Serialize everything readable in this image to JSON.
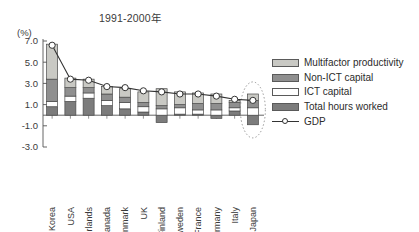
{
  "chart_data": {
    "type": "bar",
    "subtype": "stacked-bar-with-line-overlay",
    "title": "1991-2000年",
    "xlabel": "",
    "ylabel": "(%)",
    "ylim": [
      -3.0,
      7.0
    ],
    "yticks": [
      "7.0",
      "5.0",
      "3.0",
      "1.0",
      "-1.0",
      "-3.0"
    ],
    "ytick_values": [
      7.0,
      5.0,
      3.0,
      1.0,
      -1.0,
      -3.0
    ],
    "grid": false,
    "legend_position": "right",
    "categories": [
      "Korea",
      "USA",
      "Netherlands",
      "Canada",
      "Denmark",
      "UK",
      "Finland",
      "Sweden",
      "France",
      "Germany",
      "Italy",
      "Japan"
    ],
    "series": [
      {
        "name": "Total hours worked",
        "color": "#7c7c7c",
        "values": [
          0.8,
          1.3,
          1.6,
          0.9,
          0.6,
          0.3,
          -0.7,
          0.1,
          0.1,
          -0.3,
          0.4,
          -0.9
        ]
      },
      {
        "name": "ICT capital",
        "color": "#ffffff",
        "values": [
          0.5,
          0.5,
          0.5,
          0.5,
          0.6,
          0.5,
          0.6,
          0.6,
          0.4,
          0.5,
          0.3,
          0.7
        ]
      },
      {
        "name": "Non-ICT capital",
        "color": "#8f8f8f",
        "values": [
          2.1,
          0.8,
          0.5,
          0.6,
          0.5,
          0.4,
          0.3,
          0.3,
          0.6,
          0.6,
          0.5,
          0.7
        ]
      },
      {
        "name": "Multifactor productivity",
        "color": "#c9c9c4",
        "values": [
          3.3,
          0.9,
          0.8,
          0.7,
          0.8,
          1.0,
          1.6,
          1.2,
          1.0,
          0.9,
          0.2,
          0.6
        ]
      }
    ],
    "line_series": {
      "name": "GDP",
      "color": "#333333",
      "marker": "open-circle",
      "values": [
        6.6,
        3.4,
        3.3,
        2.7,
        2.6,
        2.3,
        2.2,
        2.0,
        2.0,
        1.8,
        1.5,
        1.4
      ]
    },
    "annotations": [
      {
        "type": "ellipse",
        "style": "dotted",
        "target": "Japan",
        "description": "dotted ellipse highlighting the Japan column"
      }
    ]
  },
  "legend": {
    "items": [
      {
        "label": "Multifactor productivity",
        "swatch": "light-gray",
        "color": "#c9c9c4",
        "kind": "swatch"
      },
      {
        "label": "Non-ICT capital",
        "swatch": "mid-gray",
        "color": "#8f8f8f",
        "kind": "swatch"
      },
      {
        "label": "ICT capital",
        "swatch": "white",
        "color": "#ffffff",
        "kind": "swatch"
      },
      {
        "label": "Total hours worked",
        "swatch": "dark-gray",
        "color": "#7c7c7c",
        "kind": "swatch"
      },
      {
        "label": "GDP",
        "swatch": "line-marker",
        "color": "#333333",
        "kind": "line"
      }
    ]
  },
  "axis": {
    "unit_label": "(%)"
  },
  "top_bleed": "▁ ▁▁ ▁▁▁ ▁▁ ▁"
}
